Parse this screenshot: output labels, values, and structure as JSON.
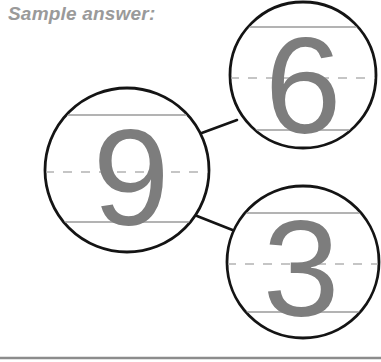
{
  "header": {
    "sample_answer_label": "Sample answer:"
  },
  "colors": {
    "label_gray": "#9a9a9a",
    "circle_stroke": "#141414",
    "connector_stroke": "#141414",
    "guideline_gray": "#b3b3b3",
    "digit_gray": "#7d7d7d",
    "divider_gray": "#8c8c8c",
    "background": "#ffffff"
  },
  "diagram": {
    "type": "number-bond",
    "whole": {
      "name": "whole-circle",
      "digit": "9",
      "cx": 127,
      "cy": 170,
      "r": 82,
      "guidelines": {
        "top": 115,
        "middle": 172,
        "bottom": 222
      }
    },
    "parts": [
      {
        "name": "part-circle-top",
        "digit": "6",
        "cx": 303,
        "cy": 75,
        "r": 73,
        "guidelines": {
          "top": 27,
          "middle": 78,
          "bottom": 130
        }
      },
      {
        "name": "part-circle-bottom",
        "digit": "3",
        "cx": 303,
        "cy": 262,
        "r": 76,
        "guidelines": {
          "top": 213,
          "middle": 264,
          "bottom": 312
        }
      }
    ],
    "connectors": [
      {
        "name": "connector-to-top-part",
        "x1": 199,
        "y1": 134,
        "x2": 237,
        "y2": 120
      },
      {
        "name": "connector-to-bottom-part",
        "x1": 197,
        "y1": 216,
        "x2": 235,
        "y2": 231
      }
    ]
  },
  "divider": {
    "label": "bottom-rule",
    "y": 358
  }
}
